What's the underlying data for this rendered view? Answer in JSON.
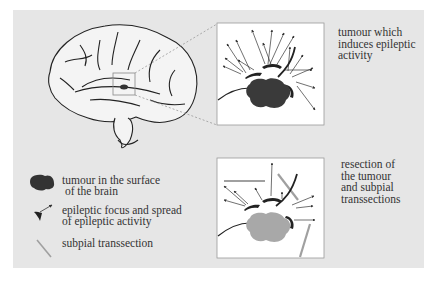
{
  "diagram": {
    "panels": [
      {
        "id": "before",
        "caption": [
          "tumour which",
          "induces epileptic",
          "activity"
        ]
      },
      {
        "id": "after",
        "caption": [
          "resection of",
          "the tumour",
          "and subpial",
          "transsections"
        ]
      }
    ],
    "legend": [
      {
        "icon": "tumour-blob-icon",
        "text": [
          "tumour in the surface",
          " of the brain"
        ]
      },
      {
        "icon": "epileptic-focus-icon",
        "text": [
          "epileptic focus and spread",
          "of epileptic activity"
        ]
      },
      {
        "icon": "transection-line-icon",
        "text": [
          "subpial transsection"
        ]
      }
    ],
    "colors": {
      "background": "#e6e6e6",
      "panel": "#ffffff",
      "tumour": "#3a3a3a",
      "resected_tumour": "#a8a8a8",
      "transection": "#a0a0a0"
    }
  }
}
